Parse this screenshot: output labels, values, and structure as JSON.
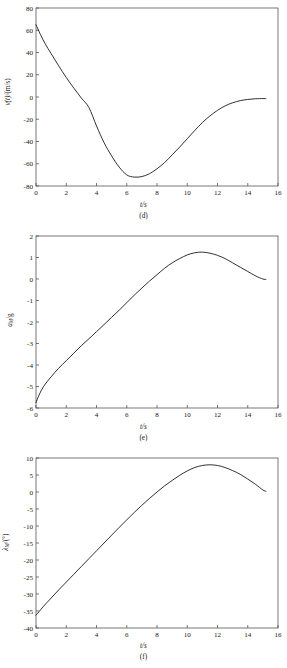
{
  "figure": {
    "panel_count": 3,
    "line_color": "#1a1a1a",
    "axis_color": "#555555",
    "background": "#ffffff"
  },
  "panels": [
    {
      "caption": "(d)",
      "xlabel": "t/s",
      "ylabel_main": "v(t)/(m/s)",
      "ylabel_pre": "v",
      "ylabel_it": "(t)",
      "ylabel_post": "/(m/s)"
    },
    {
      "caption": "(e)",
      "xlabel": "t/s",
      "ylabel_main": "aM/g",
      "ylabel_pre": "a",
      "ylabel_it": "M",
      "ylabel_post": "/g"
    },
    {
      "caption": "(f)",
      "xlabel": "t/s",
      "ylabel_main": "λM/(°)",
      "ylabel_pre": "λ",
      "ylabel_it": "M",
      "ylabel_post": "/(°)"
    }
  ],
  "chart_data": [
    {
      "type": "line",
      "title": "",
      "caption": "(d)",
      "xlabel": "t/s",
      "ylabel": "v(t)/(m/s)",
      "xlim": [
        0,
        16
      ],
      "ylim": [
        -80,
        80
      ],
      "xticks": [
        0,
        2,
        4,
        6,
        8,
        10,
        12,
        14,
        16
      ],
      "xticklabels": [
        "0",
        "2",
        "4",
        "6",
        "8",
        "10",
        "12",
        "14",
        "16"
      ],
      "yticks": [
        -80,
        -60,
        -40,
        -20,
        0,
        20,
        40,
        60,
        80
      ],
      "yticklabels": [
        "-80",
        "-60",
        "-40",
        "-20",
        "0",
        "20",
        "40",
        "60",
        "80"
      ],
      "grid": false,
      "legend": null,
      "series": [
        {
          "name": "v(t)",
          "x": [
            0,
            0.3,
            0.6,
            1.0,
            1.5,
            2.0,
            2.5,
            3.0,
            3.5,
            4.0,
            4.5,
            5.0,
            5.5,
            6.0,
            6.5,
            7.0,
            7.5,
            8.0,
            8.5,
            9.0,
            9.5,
            10.0,
            10.5,
            11.0,
            11.5,
            12.0,
            12.5,
            13.0,
            13.5,
            14.0,
            14.5,
            15.0,
            15.2
          ],
          "y": [
            65,
            56,
            48,
            39,
            28,
            17.5,
            8,
            -1,
            -9.5,
            -26,
            -41,
            -53,
            -63,
            -70,
            -72,
            -71.5,
            -69,
            -64.5,
            -59,
            -52,
            -45,
            -37.5,
            -30,
            -23,
            -17,
            -12,
            -8,
            -5.2,
            -3.3,
            -2.2,
            -1.6,
            -1.4,
            -1.5
          ]
        }
      ]
    },
    {
      "type": "line",
      "title": "",
      "caption": "(e)",
      "xlabel": "t/s",
      "ylabel": "aM/g",
      "xlim": [
        0,
        16
      ],
      "ylim": [
        -6,
        2
      ],
      "xticks": [
        0,
        2,
        4,
        6,
        8,
        10,
        12,
        14,
        16
      ],
      "xticklabels": [
        "0",
        "2",
        "4",
        "6",
        "8",
        "10",
        "12",
        "14",
        "16"
      ],
      "yticks": [
        -6,
        -5,
        -4,
        -3,
        -2,
        -1,
        0,
        1,
        2
      ],
      "yticklabels": [
        "-6",
        "-5",
        "-4",
        "-3",
        "-2",
        "-1",
        "0",
        "1",
        "2"
      ],
      "grid": false,
      "legend": null,
      "series": [
        {
          "name": "aM",
          "x": [
            0,
            0.2,
            0.5,
            1.0,
            1.5,
            2.0,
            2.5,
            3.0,
            3.5,
            4.0,
            4.5,
            5.0,
            5.5,
            6.0,
            6.5,
            7.0,
            7.5,
            8.0,
            8.5,
            9.0,
            9.5,
            10.0,
            10.5,
            11.0,
            11.5,
            12.0,
            12.5,
            13.0,
            13.5,
            14.0,
            14.5,
            15.0,
            15.2
          ],
          "y": [
            -5.75,
            -5.4,
            -5.0,
            -4.55,
            -4.15,
            -3.8,
            -3.45,
            -3.1,
            -2.78,
            -2.45,
            -2.12,
            -1.78,
            -1.45,
            -1.1,
            -0.75,
            -0.42,
            -0.1,
            0.2,
            0.5,
            0.75,
            0.95,
            1.12,
            1.22,
            1.25,
            1.2,
            1.1,
            0.95,
            0.75,
            0.55,
            0.35,
            0.15,
            0.0,
            -0.02
          ]
        }
      ]
    },
    {
      "type": "line",
      "title": "",
      "caption": "(f)",
      "xlabel": "t/s",
      "ylabel": "λM/(°)",
      "xlim": [
        0,
        16
      ],
      "ylim": [
        -40,
        10
      ],
      "xticks": [
        0,
        2,
        4,
        6,
        8,
        10,
        12,
        14,
        16
      ],
      "xticklabels": [
        "0",
        "2",
        "4",
        "6",
        "8",
        "10",
        "12",
        "14",
        "16"
      ],
      "yticks": [
        -40,
        -35,
        -30,
        -25,
        -20,
        -15,
        -10,
        -5,
        0,
        5,
        10
      ],
      "yticklabels": [
        "-40",
        "-35",
        "-30",
        "-25",
        "-20",
        "-15",
        "-10",
        "-5",
        "0",
        "5",
        "10"
      ],
      "grid": false,
      "legend": null,
      "series": [
        {
          "name": "λM",
          "x": [
            0,
            0.2,
            0.5,
            1.0,
            1.5,
            2.0,
            2.5,
            3.0,
            3.5,
            4.0,
            4.5,
            5.0,
            5.5,
            6.0,
            6.5,
            7.0,
            7.5,
            8.0,
            8.5,
            9.0,
            9.5,
            10.0,
            10.5,
            11.0,
            11.5,
            12.0,
            12.5,
            13.0,
            13.5,
            14.0,
            14.5,
            15.0,
            15.2
          ],
          "y": [
            -36.2,
            -35.2,
            -33.6,
            -31.2,
            -28.8,
            -26.5,
            -24.2,
            -21.9,
            -19.6,
            -17.3,
            -15.0,
            -12.7,
            -10.4,
            -8.2,
            -6.0,
            -3.9,
            -1.9,
            0.0,
            1.8,
            3.4,
            4.9,
            6.2,
            7.2,
            7.8,
            8.0,
            7.8,
            7.2,
            6.3,
            5.2,
            3.8,
            2.3,
            0.6,
            0.2
          ]
        }
      ]
    }
  ]
}
